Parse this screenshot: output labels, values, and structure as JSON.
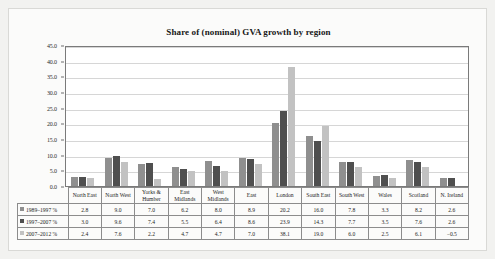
{
  "chart_data": {
    "type": "bar",
    "title": "Share of (nominal) GVA growth by region",
    "xlabel": "",
    "ylabel": "",
    "ylim": [
      0.0,
      45.0
    ],
    "ytick_labels": [
      "45.0",
      "40.0",
      "35.0",
      "30.0",
      "25.0",
      "20.0",
      "15.0",
      "10.0",
      "5.0",
      "0.0"
    ],
    "ytick_values": [
      45.0,
      40.0,
      35.0,
      30.0,
      25.0,
      20.0,
      15.0,
      10.0,
      5.0,
      0.0
    ],
    "grid": true,
    "legend_position": "table-row-labels",
    "categories": [
      "North East",
      "North West",
      "Yorks & Humber",
      "East Midlands",
      "West Midlands",
      "East",
      "London",
      "South East",
      "South West",
      "Wales",
      "Scotland",
      "N. Ireland"
    ],
    "series": [
      {
        "name": "1989–1997 %",
        "color": "#8f8f8f",
        "values": [
          2.8,
          9.0,
          7.0,
          6.2,
          8.0,
          8.9,
          20.2,
          16.0,
          7.8,
          3.3,
          8.2,
          2.6
        ],
        "labels": [
          "2.8",
          "9.0",
          "7.0",
          "6.2",
          "8.0",
          "8.9",
          "20.2",
          "16.0",
          "7.8",
          "3.3",
          "8.2",
          "2.6"
        ]
      },
      {
        "name": "1997–2007 %",
        "color": "#4f4f4f",
        "values": [
          3.0,
          9.6,
          7.4,
          5.5,
          6.4,
          8.6,
          23.9,
          14.3,
          7.7,
          3.5,
          7.6,
          2.6
        ],
        "labels": [
          "3.0",
          "9.6",
          "7.4",
          "5.5",
          "6.4",
          "8.6",
          "23.9",
          "14.3",
          "7.7",
          "3.5",
          "7.6",
          "2.6"
        ]
      },
      {
        "name": "2007–2012 %",
        "color": "#c2c2c2",
        "values": [
          2.4,
          7.6,
          2.2,
          4.7,
          4.7,
          7.0,
          38.1,
          19.0,
          6.0,
          2.5,
          6.1,
          -0.5
        ],
        "labels": [
          "2.4",
          "7.6",
          "2.2",
          "4.7",
          "4.7",
          "7.0",
          "38.1",
          "19.0",
          "6.0",
          "2.5",
          "6.1",
          "−0.5"
        ]
      }
    ]
  }
}
